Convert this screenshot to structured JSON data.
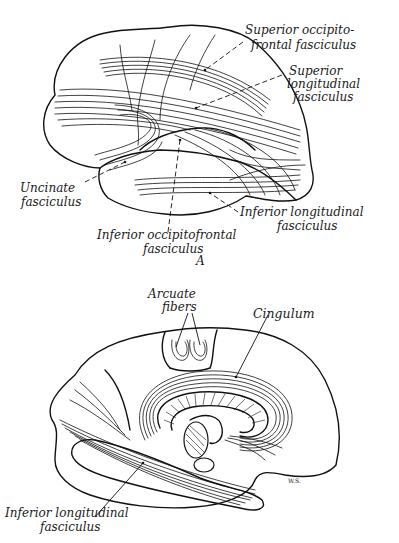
{
  "figure": {
    "panel_a": {
      "panel_letter": "A",
      "view": "lateral",
      "labels": {
        "superior_occipitofrontal": [
          "Superior occipito-",
          "frontal fasciculus"
        ],
        "superior_longitudinal": [
          "Superior",
          "longitudinal",
          "fasciculus"
        ],
        "uncinate": [
          "Uncinate",
          "fasciculus"
        ],
        "inferior_longitudinal": [
          "Inferior longitudinal",
          "fasciculus"
        ],
        "inferior_occipitofrontal": [
          "Inferior occipitofrontal",
          "fasciculus"
        ]
      }
    },
    "panel_b": {
      "view": "medial",
      "labels": {
        "arcuate_fibers": [
          "Arcuate",
          "fibers"
        ],
        "cingulum": [
          "Cingulum"
        ],
        "inferior_longitudinal": [
          "Inferior longitudinal",
          "fasciculus"
        ]
      },
      "signature": "W.S."
    }
  }
}
